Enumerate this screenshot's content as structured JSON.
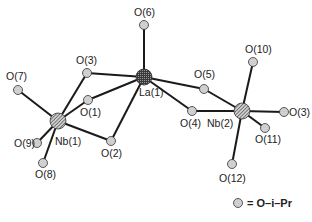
{
  "diagram": {
    "type": "molecular-structure",
    "atoms": [
      {
        "id": "La1",
        "label": "La(1)",
        "x": 144,
        "y": 77,
        "kind": "metal-dark",
        "r": 8
      },
      {
        "id": "Nb1",
        "label": "Nb(1)",
        "x": 58,
        "y": 121,
        "kind": "metal",
        "r": 8
      },
      {
        "id": "Nb2",
        "label": "Nb(2)",
        "x": 242,
        "y": 111,
        "kind": "metal",
        "r": 8
      },
      {
        "id": "O1",
        "label": "O(1)",
        "x": 88,
        "y": 100,
        "kind": "oxygen",
        "r": 4.5
      },
      {
        "id": "O2",
        "label": "O(2)",
        "x": 111,
        "y": 141,
        "kind": "oxygen",
        "r": 4.5
      },
      {
        "id": "O3",
        "label": "O(3)",
        "x": 87,
        "y": 73,
        "kind": "oxygen",
        "r": 4.5
      },
      {
        "id": "O4",
        "label": "O(4)",
        "x": 192,
        "y": 111,
        "kind": "oxygen",
        "r": 4.5
      },
      {
        "id": "O5",
        "label": "O(5)",
        "x": 204,
        "y": 89,
        "kind": "oxygen",
        "r": 4.5
      },
      {
        "id": "O6",
        "label": "O(6)",
        "x": 144,
        "y": 25,
        "kind": "oxygen",
        "r": 4.5
      },
      {
        "id": "O7",
        "label": "O(7)",
        "x": 18,
        "y": 90,
        "kind": "oxygen",
        "r": 4.5
      },
      {
        "id": "O8",
        "label": "O(8)",
        "x": 43,
        "y": 163,
        "kind": "oxygen",
        "r": 4.5
      },
      {
        "id": "O9",
        "label": "O(9)",
        "x": 37,
        "y": 143,
        "kind": "oxygen",
        "r": 4.5
      },
      {
        "id": "O10",
        "label": "O(10)",
        "x": 253,
        "y": 62,
        "kind": "oxygen",
        "r": 4.5
      },
      {
        "id": "O3b",
        "label": "O(3)",
        "x": 284,
        "y": 112,
        "kind": "oxygen",
        "r": 4.5
      },
      {
        "id": "O11",
        "label": "O(11)",
        "x": 265,
        "y": 128,
        "kind": "oxygen",
        "r": 4.5
      },
      {
        "id": "O12",
        "label": "O(12)",
        "x": 232,
        "y": 164,
        "kind": "oxygen",
        "r": 4.5
      }
    ],
    "bonds": [
      [
        "La1",
        "O6"
      ],
      [
        "La1",
        "O3"
      ],
      [
        "La1",
        "O1"
      ],
      [
        "La1",
        "O2"
      ],
      [
        "La1",
        "O5"
      ],
      [
        "La1",
        "O4"
      ],
      [
        "Nb1",
        "O3"
      ],
      [
        "Nb1",
        "O1"
      ],
      [
        "Nb1",
        "O2"
      ],
      [
        "Nb1",
        "O7"
      ],
      [
        "Nb1",
        "O9"
      ],
      [
        "Nb1",
        "O8"
      ],
      [
        "Nb2",
        "O5"
      ],
      [
        "Nb2",
        "O4"
      ],
      [
        "Nb2",
        "O10"
      ],
      [
        "Nb2",
        "O3b"
      ],
      [
        "Nb2",
        "O11"
      ],
      [
        "Nb2",
        "O12"
      ]
    ],
    "labels": [
      {
        "text": "O(6)",
        "x": 134,
        "y": 16
      },
      {
        "text": "O(10)",
        "x": 245,
        "y": 53
      },
      {
        "text": "O(3)",
        "x": 76,
        "y": 64
      },
      {
        "text": "O(7)",
        "x": 6,
        "y": 80
      },
      {
        "text": "O(5)",
        "x": 194,
        "y": 78
      },
      {
        "text": "O(1)",
        "x": 80,
        "y": 116
      },
      {
        "text": "La(1)",
        "x": 139,
        "y": 96
      },
      {
        "text": "O(4)",
        "x": 180,
        "y": 127
      },
      {
        "text": "Nb(2)",
        "x": 207,
        "y": 127
      },
      {
        "text": "O(3)",
        "x": 289,
        "y": 116
      },
      {
        "text": "O(9)",
        "x": 14,
        "y": 147
      },
      {
        "text": "Nb(1)",
        "x": 55,
        "y": 145
      },
      {
        "text": "O(11)",
        "x": 255,
        "y": 143
      },
      {
        "text": "O(2)",
        "x": 101,
        "y": 157
      },
      {
        "text": "O(8)",
        "x": 35,
        "y": 178
      },
      {
        "text": "O(12)",
        "x": 219,
        "y": 182
      }
    ],
    "legend": {
      "symbol": "oxygen",
      "text": "= O–i–Pr",
      "x": 238,
      "y": 207
    }
  }
}
